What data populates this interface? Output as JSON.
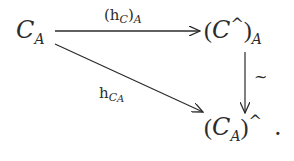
{
  "diagram": {
    "type": "commutative-triangle",
    "nodes": {
      "source": {
        "base": "C",
        "sub": "A",
        "latex": "\\mathcal{C}_A"
      },
      "top_right": {
        "open": "(",
        "base": "C",
        "sup": "^",
        "close": ")",
        "sub": "A",
        "latex": "(\\mathcal{C}^\\wedge)_A"
      },
      "bottom_right": {
        "open": "(",
        "base": "C",
        "sub": "A",
        "close": ")",
        "sup": "^",
        "trail": ".",
        "latex": "(\\mathcal{C}_A)^\\wedge ."
      }
    },
    "arrows": {
      "top": {
        "open": "(",
        "h": "h",
        "hsub": "C",
        "close": ")",
        "outer_sub": "A",
        "latex": "(h_{\\mathcal{C}})_A"
      },
      "diagonal": {
        "h": "h",
        "hsub": "C",
        "hsubsub": "A",
        "latex": "h_{\\mathcal{C}_A}"
      },
      "vertical": {
        "label": "~",
        "meaning": "isomorphism"
      }
    },
    "colors": {
      "ink": "#2b2b2b",
      "background": "#ffffff"
    }
  }
}
